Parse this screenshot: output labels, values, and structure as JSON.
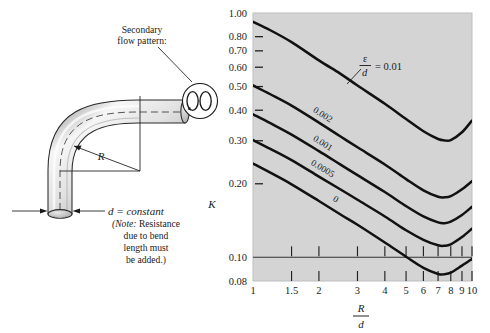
{
  "figure": {
    "background": "#ffffff",
    "plot_background": "#d4d4d4",
    "curve_color": "#111111"
  },
  "diagram": {
    "callout_label_line1": "Secondary",
    "callout_label_line2": "flow pattern:",
    "radius_label": "R",
    "diameter_label": "d = constant",
    "note_line1_italic": "(Note:",
    "note_line1_rest": " Resistance",
    "note_line2": "due to bend",
    "note_line3": "length must",
    "note_line4": "be added.)",
    "pipe_fill_light": "#f2f2f2",
    "pipe_fill_mid": "#c9c9c9",
    "pipe_outline": "#2a2a2a"
  },
  "chart_data": {
    "type": "line",
    "title": "",
    "xlabel_numerator": "R",
    "xlabel_denominator": "d",
    "ylabel": "K",
    "xscale": "log",
    "yscale": "log",
    "xlim": [
      1,
      10
    ],
    "ylim": [
      0.08,
      1.0
    ],
    "grid": false,
    "legend_position": "inline-curve-labels",
    "x_ticks": [
      1,
      1.5,
      2,
      3,
      4,
      5,
      6,
      7,
      8,
      9,
      10
    ],
    "x_tick_labels": [
      "1",
      "1.5",
      "2",
      "3",
      "4",
      "5",
      "6",
      "7",
      "8",
      "9",
      "10"
    ],
    "y_ticks": [
      0.08,
      0.1,
      0.2,
      0.3,
      0.4,
      0.5,
      0.6,
      0.7,
      0.8,
      1.0
    ],
    "y_tick_labels": [
      "0.08",
      "0.10",
      "0.20",
      "0.30",
      "0.40",
      "0.50",
      "0.60",
      "0.70",
      "0.80",
      "1.00"
    ],
    "horizontal_rule_at": 0.1,
    "legend_prefix_numerator": "ε",
    "legend_prefix_denominator": "d",
    "legend_prefix_equals": "= 0.01",
    "series": [
      {
        "name": "eps_over_d_0.01",
        "label": "ε/d = 0.01",
        "label_mode": "leader",
        "x": [
          1,
          1.2,
          1.5,
          2,
          2.5,
          3,
          4,
          5,
          6,
          7,
          7.5,
          8,
          9,
          10
        ],
        "y": [
          0.92,
          0.85,
          0.76,
          0.64,
          0.565,
          0.505,
          0.425,
          0.368,
          0.328,
          0.305,
          0.301,
          0.302,
          0.325,
          0.363
        ]
      },
      {
        "name": "eps_over_d_0.002",
        "label": "0.002",
        "label_mode": "inline",
        "x": [
          1,
          1.2,
          1.5,
          2,
          2.5,
          3,
          4,
          5,
          6,
          7,
          7.5,
          8,
          9,
          10
        ],
        "y": [
          0.505,
          0.465,
          0.418,
          0.356,
          0.313,
          0.282,
          0.24,
          0.209,
          0.188,
          0.177,
          0.176,
          0.178,
          0.19,
          0.205
        ]
      },
      {
        "name": "eps_over_d_0.001",
        "label": "0.001",
        "label_mode": "inline",
        "x": [
          1,
          1.2,
          1.5,
          2,
          2.5,
          3,
          4,
          5,
          6,
          7,
          7.5,
          8,
          9,
          10
        ],
        "y": [
          0.385,
          0.354,
          0.318,
          0.272,
          0.24,
          0.217,
          0.185,
          0.162,
          0.147,
          0.139,
          0.138,
          0.14,
          0.149,
          0.161
        ]
      },
      {
        "name": "eps_over_d_0.0005",
        "label": "0.0005",
        "label_mode": "inline",
        "x": [
          1,
          1.2,
          1.5,
          2,
          2.5,
          3,
          4,
          5,
          6,
          7,
          7.5,
          8,
          9,
          10
        ],
        "y": [
          0.302,
          0.278,
          0.25,
          0.214,
          0.19,
          0.172,
          0.147,
          0.129,
          0.118,
          0.112,
          0.1115,
          0.113,
          0.121,
          0.131
        ]
      },
      {
        "name": "eps_over_d_0",
        "label": "0",
        "label_mode": "inline",
        "x": [
          1,
          1.2,
          1.5,
          2,
          2.5,
          3,
          4,
          5,
          6,
          7,
          7.5,
          8,
          9,
          10
        ],
        "y": [
          0.242,
          0.222,
          0.199,
          0.17,
          0.15,
          0.136,
          0.115,
          0.1005,
          0.0905,
          0.0855,
          0.0853,
          0.0865,
          0.0925,
          0.0985
        ]
      }
    ]
  }
}
